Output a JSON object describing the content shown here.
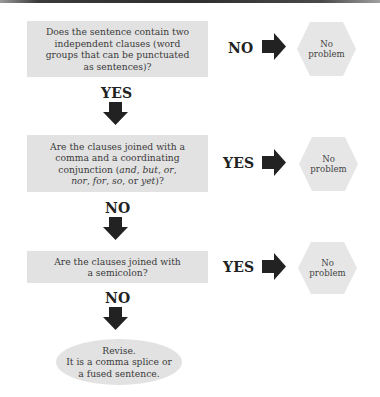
{
  "diagram": {
    "type": "flowchart",
    "title": "",
    "colors": {
      "box_fill": "#e2e2e2",
      "hex_fill": "#e6e6e6",
      "arrow": "#222222",
      "text": "#3a3a3a"
    },
    "questions": [
      {
        "lines": [
          "Does the sentence contain two",
          "independent clauses (word",
          "groups that can be punctuated",
          "as sentences)?"
        ],
        "side_label": "NO",
        "side_outcome": [
          "No",
          "problem"
        ],
        "down_label": "YES"
      },
      {
        "lines": [
          "Are the clauses joined with a",
          "comma and a coordinating"
        ],
        "line3_prefix": "conjunction (",
        "line3_italic_a": "and",
        "line3_sep1": ", ",
        "line3_italic_b": "but",
        "line3_sep2": ", ",
        "line3_italic_c": "or",
        "line3_suffix": ",",
        "line4_italic_a": "nor",
        "line4_sep1": ", ",
        "line4_italic_b": "for",
        "line4_sep2": ", ",
        "line4_italic_c": "so",
        "line4_sep3": ", or ",
        "line4_italic_d": "yet",
        "line4_suffix": ")?",
        "side_label": "YES",
        "side_outcome": [
          "No",
          "problem"
        ],
        "down_label": "NO"
      },
      {
        "lines": [
          "Are the clauses joined with",
          "a semicolon?"
        ],
        "side_label": "YES",
        "side_outcome": [
          "No",
          "problem"
        ],
        "down_label": "NO"
      }
    ],
    "final": {
      "lines": [
        "Revise.",
        "It is a comma splice or",
        "a fused sentence."
      ]
    }
  }
}
